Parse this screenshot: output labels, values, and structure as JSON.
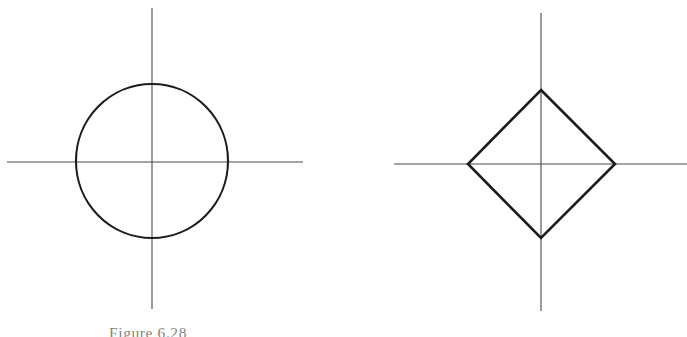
{
  "page": {
    "width": 687,
    "height": 337,
    "background_color": "#ffffff",
    "content_type": "scanned-textbook-geometry-figures"
  },
  "figures": [
    {
      "id": "figure-6-28",
      "caption": "Figure 6.28",
      "shape_name": "circle",
      "description": "A circle centered on the origin of a pair of coordinate axes",
      "stroke_color": "#1b1b1b",
      "axis_color": "#4a4a4a",
      "geometry": {
        "origin_x": 152,
        "origin_y": 162,
        "radius_x": 76,
        "radius_y": 77,
        "x_axis_start": 7,
        "x_axis_end": 303,
        "y_axis_start": 8,
        "y_axis_end": 309,
        "stroke_width": 2.1,
        "axis_stroke_width": 1.1
      }
    },
    {
      "id": "figure-6-29",
      "caption": "Figure 6.29",
      "shape_name": "diamond",
      "description": "A square rotated 45 degrees (diamond) with vertices on the coordinate axes",
      "stroke_color": "#1b1b1b",
      "axis_color": "#4a4a4a",
      "geometry": {
        "origin_x": 541,
        "origin_y": 164,
        "vertex_top_x": 541,
        "vertex_top_y": 90,
        "vertex_right_x": 615,
        "vertex_right_y": 164,
        "vertex_bottom_x": 541,
        "vertex_bottom_y": 238,
        "vertex_left_x": 468,
        "vertex_left_y": 164,
        "x_axis_start": 394,
        "x_axis_end": 687,
        "y_axis_start": 13,
        "y_axis_end": 311,
        "stroke_width": 2.6,
        "axis_stroke_width": 1.1
      }
    }
  ],
  "colors": {
    "ink": "#1b1b1b",
    "axis": "#4a4a4a",
    "caption_ink": "#35322f",
    "paper": "#ffffff"
  }
}
